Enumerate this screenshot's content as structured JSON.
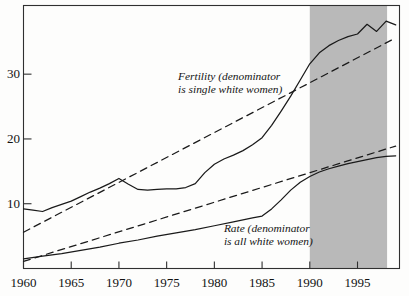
{
  "chart_data": {
    "type": "line",
    "title": "",
    "subtitle": "",
    "xlabel": "",
    "ylabel": "",
    "xlim": [
      1960,
      1999.4
    ],
    "ylim": [
      0,
      40.6
    ],
    "grid": false,
    "legend_position": "inline-annotations",
    "xticks": [
      1960,
      1965,
      1970,
      1975,
      1980,
      1985,
      1990,
      1995
    ],
    "xticklabels": [
      "1960",
      "1965",
      "1970",
      "1975",
      "1980",
      "1985",
      "1990",
      "1995"
    ],
    "yticks": [
      10,
      20,
      30
    ],
    "yticklabels": [
      "10",
      "20",
      "30"
    ],
    "shaded_region": {
      "label": "",
      "x_start": 1990,
      "x_end": 1998.1,
      "color": "#b9b9b9"
    },
    "annotations": [
      {
        "name": "fertility-annotation",
        "line1": "Fertility (denominator",
        "line2": "is single white women)",
        "x": 1976.2,
        "y": 29.6
      },
      {
        "name": "rate-annotation",
        "line1": "Rate (denominator",
        "line2": "is all white women)",
        "x": 1981.0,
        "y": 6.1
      }
    ],
    "series": [
      {
        "name": "Fertility (denominator is single white women)",
        "style": "solid",
        "color": "#1a1a1a",
        "x": [
          1960,
          1961,
          1962,
          1963,
          1964,
          1965,
          1966,
          1967,
          1968,
          1969,
          1970,
          1971,
          1972,
          1973,
          1974,
          1975,
          1976,
          1977,
          1978,
          1979,
          1980,
          1981,
          1982,
          1983,
          1984,
          1985,
          1986,
          1987,
          1988,
          1989,
          1990,
          1991,
          1992,
          1993,
          1994,
          1995,
          1996,
          1997,
          1998,
          1999
        ],
        "y": [
          9.2,
          9.0,
          8.8,
          9.4,
          9.9,
          10.4,
          11.1,
          11.8,
          12.4,
          13.1,
          13.9,
          13.0,
          12.2,
          12.1,
          12.2,
          12.3,
          12.3,
          12.5,
          13.1,
          14.8,
          16.1,
          16.9,
          17.5,
          18.2,
          19.1,
          20.2,
          22.1,
          24.3,
          26.6,
          29.1,
          31.6,
          33.3,
          34.4,
          35.2,
          35.8,
          36.2,
          37.7,
          36.6,
          38.2,
          37.6
        ]
      },
      {
        "name": "Fertility trend (dashed)",
        "style": "dashed",
        "color": "#1a1a1a",
        "x": [
          1960,
          1999
        ],
        "y": [
          5.6,
          35.6
        ]
      },
      {
        "name": "Rate (denominator is all white women)",
        "style": "solid",
        "color": "#1a1a1a",
        "x": [
          1960,
          1962,
          1964,
          1966,
          1968,
          1970,
          1972,
          1974,
          1976,
          1978,
          1980,
          1982,
          1984,
          1985,
          1986,
          1987,
          1988,
          1989,
          1990,
          1991,
          1992,
          1993,
          1994,
          1995,
          1996,
          1997,
          1998,
          1999
        ],
        "y": [
          1.5,
          1.9,
          2.3,
          2.8,
          3.3,
          3.9,
          4.4,
          5.0,
          5.5,
          6.0,
          6.6,
          7.2,
          7.8,
          8.1,
          9.2,
          10.6,
          12.1,
          13.3,
          14.2,
          14.9,
          15.4,
          15.8,
          16.2,
          16.5,
          16.8,
          17.1,
          17.3,
          17.4
        ]
      },
      {
        "name": "Rate trend (dashed)",
        "style": "dashed",
        "color": "#1a1a1a",
        "x": [
          1960,
          1999
        ],
        "y": [
          1.1,
          18.9
        ]
      }
    ]
  }
}
